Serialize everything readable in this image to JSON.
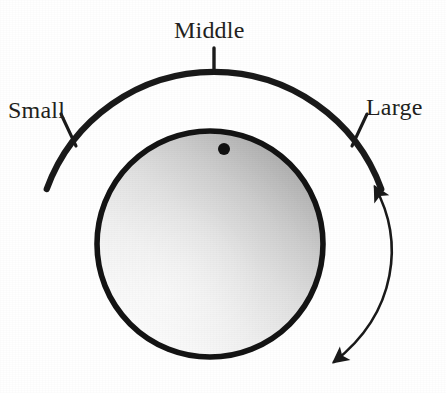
{
  "figure": {
    "type": "rotary-knob-control-diagram",
    "canvas": {
      "width": 446,
      "height": 393,
      "background": "#ffffff"
    },
    "scale": {
      "labels": [
        {
          "key": "small",
          "text": "Small",
          "position": "left",
          "tick_angle_deg": 200
        },
        {
          "key": "middle",
          "text": "Middle",
          "position": "top",
          "tick_angle_deg": 270
        },
        {
          "key": "large",
          "text": "Large",
          "position": "right",
          "tick_angle_deg": 340
        }
      ],
      "arc": {
        "center": [
          214,
          250
        ],
        "radius": 178,
        "start_deg": 200,
        "end_deg": 340,
        "stroke": "#1a1a1a",
        "stroke_width": 6
      },
      "ticks": {
        "stroke": "#1a1a1a",
        "stroke_width": 3
      }
    },
    "knob": {
      "center": [
        210,
        244
      ],
      "radius": 116,
      "rim_color": "#141414",
      "rim_width": 6,
      "face_gradient": {
        "type": "linear",
        "direction": "bottom-left-to-top-right",
        "light": "#fbfbfb",
        "mid": "#dcdcdc",
        "dark": "#a6a6a6"
      },
      "indicator_dot": {
        "center": [
          224,
          149
        ],
        "radius": 6,
        "color": "#111111",
        "angle_deg": 277
      }
    },
    "rotation_arrow": {
      "style": "double-headed-curved",
      "stroke": "#1a1a1a",
      "stroke_width": 2.6,
      "head_top": [
        374,
        184
      ],
      "head_bottom": [
        331,
        366
      ],
      "bulge": "outward-right"
    }
  }
}
